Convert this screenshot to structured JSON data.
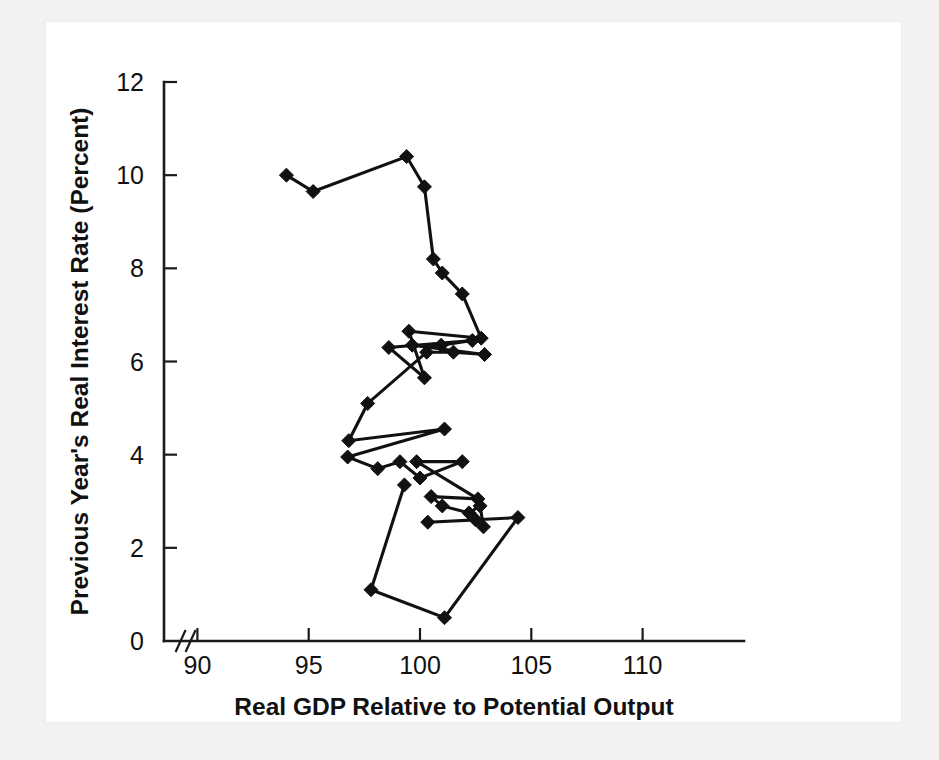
{
  "figure": {
    "background_color": "#f2f2f0",
    "card_color": "#ffffff",
    "ink_color": "#111111"
  },
  "chart_data": {
    "type": "line",
    "title": "",
    "subtitle": "",
    "xlabel": "Real GDP Relative to Potential Output",
    "ylabel": "Previous Year's Real Interest Rate (Percent)",
    "xlim": [
      88.5,
      111.5
    ],
    "ylim": [
      0,
      12
    ],
    "xticks": [
      90,
      95,
      100,
      105,
      110
    ],
    "yticks": [
      0,
      2,
      4,
      6,
      8,
      10,
      12
    ],
    "xtick_labels": [
      "90",
      "95",
      "100",
      "105",
      "110"
    ],
    "ytick_labels": [
      "0",
      "2",
      "4",
      "6",
      "8",
      "10",
      "12"
    ],
    "grid": false,
    "legend": "none",
    "axis_break": {
      "axis": "x",
      "symbol": "//",
      "position": 89.2
    },
    "marker": "diamond",
    "marker_size": 11,
    "connected": true,
    "series": [
      {
        "name": "Real GDP vs previous year's real interest rate",
        "points": [
          [
            94.0,
            10.0
          ],
          [
            95.2,
            9.65
          ],
          [
            99.4,
            10.4
          ],
          [
            100.2,
            9.75
          ],
          [
            100.6,
            8.2
          ],
          [
            101.0,
            7.9
          ],
          [
            101.9,
            7.45
          ],
          [
            102.75,
            6.5
          ],
          [
            99.5,
            6.65
          ],
          [
            100.2,
            5.65
          ],
          [
            98.6,
            6.3
          ],
          [
            102.35,
            6.45
          ],
          [
            100.95,
            6.35
          ],
          [
            99.65,
            6.35
          ],
          [
            102.9,
            6.15
          ],
          [
            101.5,
            6.2
          ],
          [
            100.3,
            6.2
          ],
          [
            97.65,
            5.1
          ],
          [
            96.8,
            4.3
          ],
          [
            101.1,
            4.55
          ],
          [
            96.75,
            3.95
          ],
          [
            98.1,
            3.7
          ],
          [
            99.1,
            3.85
          ],
          [
            100.0,
            3.5
          ],
          [
            101.9,
            3.85
          ],
          [
            99.85,
            3.85
          ],
          [
            102.6,
            3.05
          ],
          [
            100.5,
            3.1
          ],
          [
            101.0,
            2.9
          ],
          [
            102.2,
            2.75
          ],
          [
            102.7,
            2.9
          ],
          [
            102.85,
            2.45
          ],
          [
            102.5,
            2.6
          ],
          [
            100.35,
            2.55
          ],
          [
            104.4,
            2.65
          ],
          [
            101.1,
            0.5
          ],
          [
            97.8,
            1.1
          ],
          [
            99.3,
            3.35
          ]
        ]
      }
    ]
  }
}
